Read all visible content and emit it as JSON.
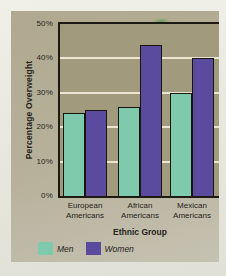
{
  "figure": {
    "page_background": "#e9e8e0",
    "card_background": "#b7b19b",
    "border_color": "#1c1a12",
    "text_color": "#26241a",
    "artifact_color": "#4a9646"
  },
  "chart_data": {
    "type": "bar",
    "title": "",
    "xlabel": "Ethnic Group",
    "ylabel": "Percentage Overweight",
    "categories": [
      "European Americans",
      "African Americans",
      "Mexican Americans"
    ],
    "series": [
      {
        "name": "Men",
        "color": "#7fc9ac",
        "values": [
          24,
          26,
          30
        ]
      },
      {
        "name": "Women",
        "color": "#5a4b9e",
        "values": [
          25,
          44,
          40
        ]
      }
    ],
    "ylim": [
      0,
      50
    ],
    "ytick_values": [
      0,
      10,
      20,
      30,
      40,
      50
    ],
    "yticks": [
      "0%",
      "10%",
      "20%",
      "30%",
      "40%",
      "50%"
    ],
    "grid": true,
    "grid_values": [
      10,
      20,
      30,
      40
    ],
    "gridline_color": "#ebe5d2",
    "plot_background": "#a29a7c",
    "legend_position": "bottom-left"
  }
}
